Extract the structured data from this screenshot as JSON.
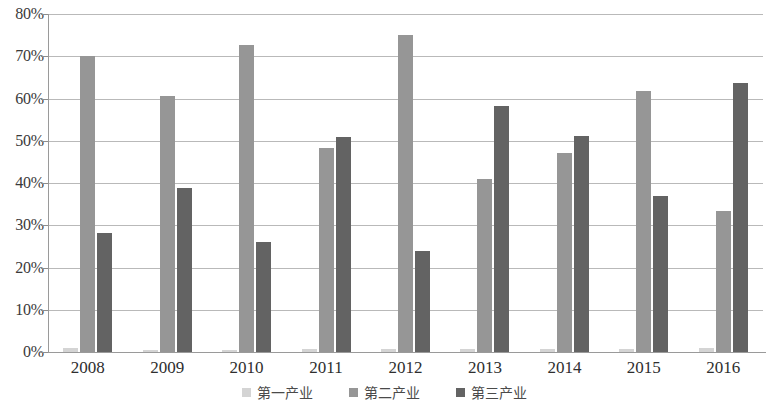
{
  "chart_data": {
    "type": "bar",
    "title": "",
    "xlabel": "",
    "ylabel": "",
    "categories": [
      "2008",
      "2009",
      "2010",
      "2011",
      "2012",
      "2013",
      "2014",
      "2015",
      "2016"
    ],
    "series": [
      {
        "name": "第一产业",
        "color": "#d4d4d4",
        "values": [
          1.0,
          0.4,
          0.5,
          0.6,
          0.6,
          0.6,
          0.7,
          0.8,
          0.9
        ]
      },
      {
        "name": "第二产业",
        "color": "#969696",
        "values": [
          70.0,
          60.5,
          72.7,
          48.2,
          75.0,
          41.0,
          47.2,
          61.7,
          33.3
        ]
      },
      {
        "name": "第三产业",
        "color": "#636363",
        "values": [
          28.2,
          38.8,
          26.0,
          50.8,
          23.9,
          58.2,
          51.1,
          37.0,
          63.7
        ]
      }
    ],
    "ylim": [
      0,
      80
    ],
    "ytick_values": [
      0,
      10,
      20,
      30,
      40,
      50,
      60,
      70,
      80
    ],
    "ytick_labels": [
      "0%",
      "10%",
      "20%",
      "30%",
      "40%",
      "50%",
      "60%",
      "70%",
      "80%"
    ],
    "grid": true,
    "legend_position": "bottom",
    "legend": [
      "第一产业",
      "第二产业",
      "第三产业"
    ],
    "colors": {
      "series1": "#d4d4d4",
      "series2": "#969696",
      "series3": "#636363",
      "gridline": "#b9b9b9",
      "axis": "#9a9a9a",
      "text": "#3a3a3a",
      "background": "#ffffff"
    }
  }
}
